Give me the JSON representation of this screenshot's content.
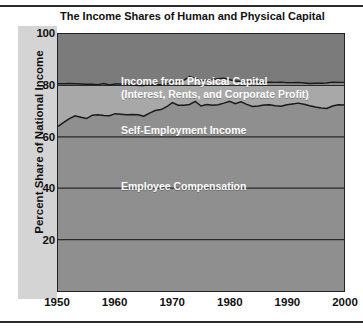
{
  "figure": {
    "title": "The Income Shares of Human and Physical Capital",
    "ylabel": "Percent Share of National Income",
    "rule_color": "#2b2b2b"
  },
  "band_labels": {
    "physical_line1": "Income from Physical Capital",
    "physical_line2": "(Interest, Rents, and Corporate Profit)",
    "self_employment": "Self-Employment Income",
    "employee": "Employee Compensation"
  },
  "chart_data": {
    "type": "area",
    "title": "The Income Shares of Human and Physical Capital",
    "subtitle": "",
    "xlabel": "",
    "ylabel": "Percent Share of National Income",
    "xlim": [
      1950,
      2000
    ],
    "ylim": [
      0,
      100
    ],
    "grid": true,
    "gridlines_y": [
      20,
      40,
      60,
      80
    ],
    "legend_position": "inline-band-labels",
    "xticks": [
      1950,
      1960,
      1970,
      1980,
      1990,
      2000
    ],
    "yticks": [
      20,
      40,
      60,
      80,
      100
    ],
    "stacked": true,
    "colors": {
      "employee_compensation": "#8f8f8f",
      "self_employment_income": "#a8a8a8",
      "income_from_physical_capital": "#7b7b7b",
      "curve_line": "#1a1a1a",
      "axis": "#222222",
      "ylabel_strip": "#d4d4d4",
      "background": "#ffffff"
    },
    "x": [
      1950,
      1951,
      1952,
      1953,
      1954,
      1955,
      1956,
      1957,
      1958,
      1959,
      1960,
      1961,
      1962,
      1963,
      1964,
      1965,
      1966,
      1967,
      1968,
      1969,
      1970,
      1971,
      1972,
      1973,
      1974,
      1975,
      1976,
      1977,
      1978,
      1979,
      1980,
      1981,
      1982,
      1983,
      1984,
      1985,
      1986,
      1987,
      1988,
      1989,
      1990,
      1991,
      1992,
      1993,
      1994,
      1995,
      1996,
      1997,
      1998,
      1999,
      2000
    ],
    "series": [
      {
        "name": "Employee Compensation",
        "label": "Employee Compensation",
        "values": [
          64.0,
          65.6,
          67.1,
          68.2,
          67.6,
          67.1,
          68.4,
          68.6,
          68.3,
          68.2,
          69.0,
          68.8,
          68.6,
          68.7,
          68.6,
          68.0,
          69.2,
          70.2,
          70.6,
          71.7,
          73.3,
          72.3,
          72.3,
          72.6,
          73.8,
          72.0,
          72.6,
          72.3,
          72.5,
          73.1,
          73.8,
          72.9,
          73.6,
          72.6,
          71.8,
          72.0,
          72.4,
          72.5,
          72.1,
          71.9,
          72.5,
          72.8,
          73.1,
          72.7,
          72.1,
          71.6,
          71.2,
          71.0,
          72.0,
          72.5,
          72.4
        ]
      },
      {
        "name": "Self-Employment Income",
        "label": "Self-Employment Income",
        "values": [
          16.6,
          15.0,
          13.6,
          12.4,
          12.9,
          13.3,
          12.0,
          11.7,
          12.4,
          12.0,
          11.5,
          11.7,
          11.9,
          11.5,
          11.4,
          12.0,
          11.1,
          10.1,
          9.7,
          8.8,
          8.0,
          9.3,
          9.7,
          10.8,
          9.0,
          9.7,
          9.4,
          9.9,
          10.1,
          9.7,
          8.4,
          8.8,
          7.9,
          8.8,
          9.6,
          9.3,
          8.6,
          8.7,
          9.0,
          9.3,
          8.5,
          8.2,
          8.0,
          8.2,
          8.6,
          9.2,
          9.6,
          9.9,
          9.2,
          8.6,
          8.7
        ]
      },
      {
        "name": "Income from Physical Capital (Interest, Rents, and Corporate Profit)",
        "label": "Income from Physical Capital",
        "values": [
          19.4,
          19.4,
          19.3,
          19.4,
          19.5,
          19.6,
          19.6,
          19.7,
          19.3,
          19.8,
          19.5,
          19.5,
          19.5,
          19.8,
          20.0,
          20.0,
          19.7,
          19.7,
          19.7,
          19.5,
          18.7,
          18.4,
          18.0,
          16.6,
          17.2,
          18.3,
          18.0,
          17.8,
          17.4,
          17.2,
          17.8,
          18.3,
          18.5,
          18.6,
          18.6,
          18.7,
          19.0,
          18.8,
          18.9,
          18.8,
          19.0,
          19.0,
          18.9,
          19.1,
          19.3,
          19.2,
          19.2,
          19.1,
          18.8,
          18.9,
          18.9
        ]
      }
    ],
    "cumulative_upper_boundaries": {
      "employee_top": [
        64.0,
        65.6,
        67.1,
        68.2,
        67.6,
        67.1,
        68.4,
        68.6,
        68.3,
        68.2,
        69.0,
        68.8,
        68.6,
        68.7,
        68.6,
        68.0,
        69.2,
        70.2,
        70.6,
        71.7,
        73.3,
        72.3,
        72.3,
        72.6,
        73.8,
        72.0,
        72.6,
        72.3,
        72.5,
        73.1,
        73.8,
        72.9,
        73.6,
        72.6,
        71.8,
        72.0,
        72.4,
        72.5,
        72.1,
        71.9,
        72.5,
        72.8,
        73.1,
        72.7,
        72.1,
        71.6,
        71.2,
        71.0,
        72.0,
        72.5,
        72.4
      ],
      "self_employment_top": [
        80.6,
        80.6,
        80.7,
        80.6,
        80.5,
        80.4,
        80.4,
        80.3,
        80.7,
        80.2,
        80.5,
        80.5,
        80.5,
        80.2,
        80.0,
        80.0,
        80.3,
        80.3,
        80.3,
        80.5,
        81.3,
        81.6,
        82.0,
        83.4,
        82.8,
        81.7,
        82.0,
        82.2,
        82.6,
        82.8,
        82.2,
        81.7,
        81.5,
        81.4,
        81.4,
        81.3,
        81.0,
        81.2,
        81.1,
        81.2,
        81.0,
        81.0,
        81.1,
        80.9,
        80.7,
        80.8,
        80.8,
        80.9,
        81.2,
        81.1,
        81.1
      ]
    }
  },
  "axes": {
    "yticks": [
      "100",
      "80",
      "60",
      "40",
      "20"
    ],
    "ytick_values": [
      100,
      80,
      60,
      40,
      20
    ],
    "xticks": [
      "1950",
      "1960",
      "1970",
      "1980",
      "1990",
      "2000"
    ],
    "xtick_values": [
      1950,
      1960,
      1970,
      1980,
      1990,
      2000
    ]
  }
}
